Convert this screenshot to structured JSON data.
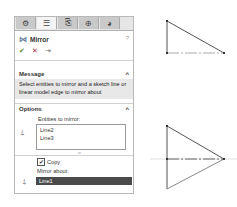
{
  "property_manager": {
    "tabs": [
      {
        "icon": "feature-manager-icon",
        "glyph": "⚙"
      },
      {
        "icon": "property-manager-icon",
        "glyph": "☰",
        "active": true
      },
      {
        "icon": "configuration-manager-icon",
        "glyph": "⎘"
      },
      {
        "icon": "dimxpert-icon",
        "glyph": "⊕"
      },
      {
        "icon": "display-manager-icon",
        "glyph": "◕"
      }
    ],
    "title": "Mirror",
    "title_icon": "mirror-icon",
    "help_label": "?",
    "actions": {
      "ok": "✔",
      "cancel": "✕",
      "pin": "⇥"
    },
    "message": {
      "header": "Message",
      "text": "Select entities to mirror and a sketch line or linear model edge to mirror about"
    },
    "options": {
      "header": "Options",
      "entities_label": "Entities to mirror:",
      "entities": [
        "Line2",
        "Line3"
      ],
      "copy_label": "Copy",
      "copy_checked": true,
      "mirror_about_label": "Mirror about:",
      "mirror_about_value": "Line1"
    },
    "collapse_glyph": "^"
  },
  "viewport": {
    "before": {
      "points": [
        [
          165,
          22
        ],
        [
          165,
          51
        ],
        [
          223,
          51
        ]
      ]
    },
    "after": {
      "points": [
        [
          165,
          125
        ],
        [
          223,
          157
        ],
        [
          165,
          189
        ]
      ]
    }
  }
}
